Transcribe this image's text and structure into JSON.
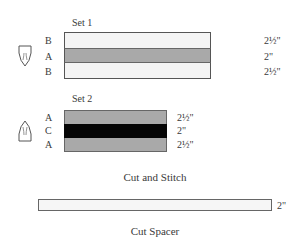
{
  "set1": {
    "title": "Set 1",
    "icon": "iron-point-down-icon",
    "rows": [
      {
        "letter": "B",
        "size": "2½\"",
        "color": "#f4f4f4"
      },
      {
        "letter": "A",
        "size": "2\"",
        "color": "#a9a9a9"
      },
      {
        "letter": "B",
        "size": "2½\"",
        "color": "#f4f4f4"
      }
    ]
  },
  "set2": {
    "title": "Set 2",
    "icon": "iron-point-up-icon",
    "rows": [
      {
        "letter": "A",
        "size": "2½\"",
        "color": "#a9a9a9"
      },
      {
        "letter": "C",
        "size": "2\"",
        "color": "#050505"
      },
      {
        "letter": "A",
        "size": "2½\"",
        "color": "#a9a9a9"
      }
    ]
  },
  "captions": {
    "cut_and_stitch": "Cut and Stitch",
    "cut_spacer": "Cut Spacer"
  },
  "spacer": {
    "size": "2\"",
    "color": "#f6f6f6"
  }
}
